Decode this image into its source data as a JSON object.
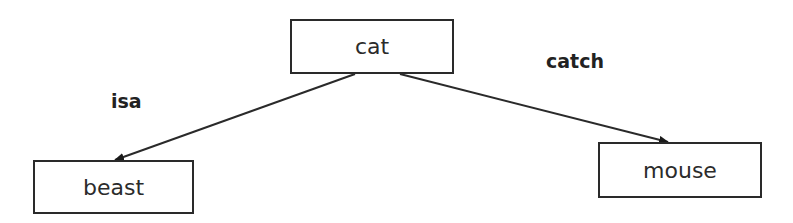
{
  "diagram": {
    "nodes": [
      {
        "id": "cat",
        "label": "cat",
        "x": 290,
        "y": 19,
        "w": 164,
        "h": 55
      },
      {
        "id": "beast",
        "label": "beast",
        "x": 33,
        "y": 160,
        "w": 161,
        "h": 54
      },
      {
        "id": "mouse",
        "label": "mouse",
        "x": 598,
        "y": 142,
        "w": 164,
        "h": 56
      }
    ],
    "edges": [
      {
        "from": "cat",
        "to": "beast",
        "label": "isa",
        "x1": 355,
        "y1": 74,
        "x2": 115,
        "y2": 160
      },
      {
        "from": "cat",
        "to": "mouse",
        "label": "catch",
        "x1": 400,
        "y1": 74,
        "x2": 668,
        "y2": 142
      }
    ],
    "edge_labels": [
      {
        "text": "isa",
        "x": 111,
        "y": 90
      },
      {
        "text": "catch",
        "x": 546,
        "y": 50
      }
    ],
    "colors": {
      "stroke": "#2a2a2a",
      "text": "#2b2b2b"
    }
  }
}
